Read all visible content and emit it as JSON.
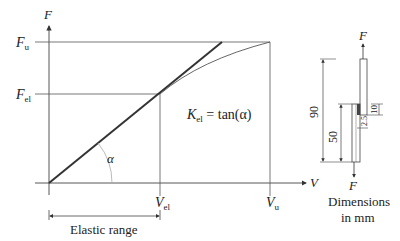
{
  "axes": {
    "y_label": "F",
    "x_label": "V"
  },
  "y_ticks": {
    "fu": {
      "main": "F",
      "sub": "u"
    },
    "fel": {
      "main": "F",
      "sub": "el"
    }
  },
  "x_ticks": {
    "vel": {
      "main": "V",
      "sub": "el"
    },
    "vu": {
      "main": "V",
      "sub": "u"
    }
  },
  "angle_label": "α",
  "stiffness": {
    "main": "K",
    "sub": "el",
    "eq": " = tan(α)"
  },
  "elastic_range_label": "Elastic range",
  "specimen": {
    "force_top": "F",
    "force_bottom": "F",
    "dim_total": "90",
    "dim_overlap_base": "50",
    "dim_weld": "10",
    "dim_small": "2.5",
    "caption_line1": "Dimensions",
    "caption_line2": "in mm"
  },
  "colors": {
    "line": "#333333",
    "thin": "#555555",
    "arc": "#aaaaaa",
    "weld": "#444444"
  }
}
